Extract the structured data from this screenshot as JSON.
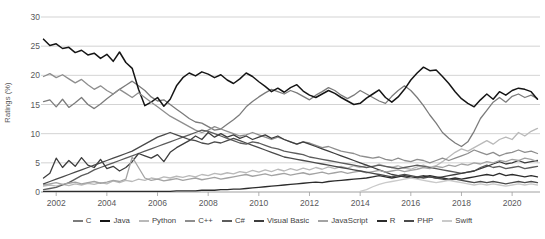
{
  "chart_data": {
    "type": "line",
    "title": "",
    "subtitle": "",
    "xlabel": "",
    "ylabel": "Ratings (%)",
    "xlim": [
      2001.4,
      2021.1
    ],
    "ylim": [
      0,
      30
    ],
    "grid": true,
    "grid_axis": "y",
    "legend_position": "bottom",
    "y_ticks": [
      0,
      5,
      10,
      15,
      20,
      25,
      30
    ],
    "y_tick_labels": [
      "0",
      "5",
      "10",
      "15",
      "20",
      "25",
      "30"
    ],
    "x_ticks": [
      2002,
      2004,
      2006,
      2008,
      2010,
      2012,
      2014,
      2016,
      2018,
      2020
    ],
    "x_tick_labels": [
      "2002",
      "2004",
      "2006",
      "2008",
      "2010",
      "2012",
      "2014",
      "2016",
      "2018",
      "2020"
    ],
    "x": [
      2001.5,
      2001.75,
      2002.0,
      2002.25,
      2002.5,
      2002.75,
      2003.0,
      2003.25,
      2003.5,
      2003.75,
      2004.0,
      2004.25,
      2004.5,
      2004.75,
      2005.0,
      2005.25,
      2005.5,
      2005.75,
      2006.0,
      2006.25,
      2006.5,
      2006.75,
      2007.0,
      2007.25,
      2007.5,
      2007.75,
      2008.0,
      2008.25,
      2008.5,
      2008.75,
      2009.0,
      2009.25,
      2009.5,
      2009.75,
      2010.0,
      2010.25,
      2010.5,
      2010.75,
      2011.0,
      2011.25,
      2011.5,
      2011.75,
      2012.0,
      2012.25,
      2012.5,
      2012.75,
      2013.0,
      2013.25,
      2013.5,
      2013.75,
      2014.0,
      2014.25,
      2014.5,
      2014.75,
      2015.0,
      2015.25,
      2015.5,
      2015.75,
      2016.0,
      2016.25,
      2016.5,
      2016.75,
      2017.0,
      2017.25,
      2017.5,
      2017.75,
      2018.0,
      2018.25,
      2018.5,
      2018.75,
      2019.0,
      2019.25,
      2019.5,
      2019.75,
      2020.0,
      2020.25,
      2020.5,
      2020.75,
      2021.0
    ],
    "series": [
      {
        "name": "C",
        "color": "#7b7b7b",
        "width": 1.3,
        "values": [
          15.5,
          15.8,
          14.6,
          15.9,
          14.5,
          15.3,
          16.2,
          15.0,
          14.3,
          15.1,
          16.0,
          16.8,
          17.6,
          18.3,
          19.0,
          18.2,
          17.4,
          16.3,
          15.6,
          15.8,
          15.0,
          14.2,
          13.4,
          12.6,
          12.0,
          11.8,
          11.2,
          10.6,
          10.8,
          11.6,
          12.4,
          13.3,
          14.6,
          15.5,
          16.3,
          17.0,
          17.6,
          17.2,
          16.8,
          17.4,
          17.0,
          16.4,
          15.8,
          16.6,
          17.2,
          17.9,
          17.4,
          16.6,
          16.0,
          16.6,
          17.4,
          16.8,
          16.2,
          15.6,
          15.2,
          16.4,
          17.4,
          18.2,
          17.4,
          16.2,
          14.8,
          13.2,
          11.8,
          10.2,
          9.2,
          8.4,
          7.8,
          8.6,
          10.4,
          12.6,
          14.0,
          15.4,
          16.2,
          15.4,
          16.4,
          16.8,
          16.2,
          16.6,
          16.0
        ]
      },
      {
        "name": "Java",
        "color": "#151515",
        "width": 1.5,
        "values": [
          26.2,
          25.1,
          25.4,
          24.6,
          24.8,
          23.9,
          24.3,
          23.5,
          23.8,
          22.9,
          23.6,
          22.4,
          24.0,
          22.2,
          21.2,
          17.6,
          14.8,
          15.4,
          16.2,
          14.7,
          15.9,
          18.2,
          19.6,
          20.4,
          19.9,
          20.6,
          20.2,
          19.6,
          20.1,
          19.2,
          18.6,
          19.4,
          20.4,
          19.8,
          18.9,
          18.1,
          17.2,
          17.8,
          17.1,
          17.9,
          18.4,
          17.3,
          16.6,
          16.2,
          16.8,
          17.4,
          16.9,
          16.2,
          15.6,
          15.0,
          15.2,
          16.1,
          16.8,
          17.5,
          16.2,
          15.4,
          16.3,
          17.6,
          19.2,
          20.4,
          21.4,
          20.8,
          20.9,
          19.8,
          18.6,
          17.2,
          16.0,
          15.2,
          14.6,
          15.8,
          16.8,
          15.9,
          17.2,
          16.6,
          17.4,
          17.8,
          17.6,
          17.2,
          15.9
        ]
      },
      {
        "name": "Python",
        "color": "#b9b9b9",
        "width": 1.3,
        "values": [
          1.0,
          1.2,
          1.0,
          1.3,
          1.1,
          1.4,
          1.2,
          1.5,
          1.3,
          1.6,
          1.4,
          1.9,
          1.6,
          2.0,
          1.8,
          2.2,
          2.0,
          2.4,
          2.2,
          2.6,
          2.4,
          2.7,
          2.5,
          2.8,
          2.6,
          3.0,
          2.8,
          3.2,
          3.0,
          3.3,
          3.1,
          3.5,
          3.3,
          3.7,
          3.4,
          3.8,
          3.5,
          3.9,
          3.6,
          4.0,
          3.7,
          4.1,
          3.8,
          4.2,
          3.9,
          4.3,
          4.0,
          4.4,
          4.1,
          4.5,
          4.2,
          4.6,
          4.3,
          4.8,
          4.4,
          4.2,
          4.5,
          4.1,
          3.9,
          4.3,
          4.6,
          4.2,
          4.5,
          5.2,
          6.0,
          6.8,
          7.4,
          7.0,
          7.6,
          8.2,
          8.8,
          8.2,
          9.0,
          9.4,
          9.0,
          10.2,
          9.6,
          10.4,
          10.9
        ]
      },
      {
        "name": "C++",
        "color": "#8e8e8e",
        "width": 1.3,
        "values": [
          19.8,
          20.3,
          19.6,
          20.1,
          19.4,
          18.7,
          19.3,
          18.4,
          17.6,
          18.2,
          17.4,
          16.8,
          17.6,
          16.9,
          16.2,
          17.0,
          16.2,
          15.4,
          14.6,
          13.8,
          13.0,
          12.4,
          11.8,
          11.2,
          10.6,
          10.2,
          10.6,
          11.2,
          10.8,
          10.4,
          10.0,
          9.6,
          9.8,
          10.2,
          9.8,
          9.4,
          9.0,
          9.4,
          9.0,
          8.6,
          8.2,
          8.6,
          8.4,
          8.0,
          7.6,
          7.8,
          7.4,
          7.0,
          6.8,
          6.6,
          6.2,
          6.0,
          5.8,
          6.0,
          5.6,
          5.4,
          5.8,
          5.4,
          5.2,
          5.6,
          5.4,
          5.0,
          5.4,
          5.8,
          5.4,
          5.8,
          6.2,
          6.6,
          7.2,
          6.8,
          6.4,
          6.8,
          6.2,
          6.6,
          6.8,
          7.2,
          6.8,
          7.0,
          6.6
        ]
      },
      {
        "name": "C#",
        "color": "#5c5c5c",
        "width": 1.3,
        "values": [
          0.4,
          0.6,
          0.8,
          1.2,
          1.6,
          2.2,
          2.8,
          3.2,
          3.8,
          4.2,
          4.6,
          5.0,
          5.4,
          5.8,
          6.2,
          6.6,
          7.0,
          7.4,
          7.8,
          8.2,
          8.6,
          9.0,
          9.4,
          9.8,
          10.2,
          10.6,
          10.4,
          10.0,
          9.6,
          9.2,
          8.8,
          8.4,
          8.2,
          8.6,
          8.4,
          8.0,
          7.6,
          7.4,
          7.0,
          6.8,
          6.6,
          6.4,
          6.0,
          5.8,
          5.6,
          5.4,
          5.2,
          5.0,
          4.8,
          4.6,
          4.4,
          4.2,
          4.4,
          4.6,
          4.4,
          4.2,
          4.0,
          4.2,
          4.4,
          4.6,
          4.4,
          4.2,
          4.0,
          3.8,
          3.6,
          3.4,
          3.2,
          3.4,
          3.6,
          4.2,
          4.6,
          4.2,
          4.4,
          4.0,
          4.2,
          4.4,
          4.0,
          4.2,
          4.4
        ]
      },
      {
        "name": "Visual Basic",
        "color": "#3d3d3d",
        "width": 1.3,
        "values": [
          2.4,
          3.2,
          5.8,
          4.2,
          5.4,
          4.4,
          5.9,
          4.6,
          4.2,
          5.6,
          4.0,
          4.4,
          3.6,
          4.2,
          5.2,
          6.6,
          6.2,
          5.8,
          6.4,
          5.2,
          6.8,
          7.6,
          8.2,
          8.8,
          9.6,
          9.0,
          10.2,
          9.4,
          10.0,
          9.4,
          9.8,
          9.2,
          9.6,
          9.0,
          9.4,
          9.8,
          9.2,
          9.6,
          9.0,
          8.6,
          8.2,
          8.6,
          8.2,
          7.8,
          7.4,
          7.0,
          6.6,
          6.2,
          5.8,
          5.4,
          5.0,
          4.6,
          4.2,
          3.8,
          3.4,
          3.0,
          2.8,
          2.6,
          2.4,
          2.6,
          2.8,
          2.6,
          2.4,
          2.6,
          2.8,
          3.0,
          3.2,
          3.4,
          3.6,
          4.0,
          4.4,
          4.8,
          5.2,
          4.8,
          5.0,
          5.4,
          5.0,
          5.2,
          5.4
        ]
      },
      {
        "name": "JavaScript",
        "color": "#a3a3a3",
        "width": 1.3,
        "values": [
          1.2,
          1.4,
          1.6,
          1.3,
          1.5,
          1.7,
          1.4,
          1.6,
          1.8,
          1.5,
          1.7,
          2.0,
          1.8,
          2.2,
          6.0,
          4.2,
          2.4,
          2.0,
          2.2,
          1.9,
          2.1,
          2.3,
          2.0,
          2.2,
          2.4,
          2.1,
          2.3,
          2.5,
          2.2,
          2.4,
          2.6,
          2.8,
          3.0,
          2.7,
          2.9,
          3.1,
          2.8,
          3.0,
          3.2,
          2.9,
          3.1,
          3.3,
          3.0,
          3.2,
          3.4,
          3.1,
          3.3,
          3.5,
          3.2,
          3.4,
          3.6,
          3.3,
          3.5,
          3.7,
          3.4,
          3.6,
          3.8,
          3.5,
          3.7,
          3.9,
          4.2,
          4.0,
          4.4,
          4.2,
          4.6,
          4.4,
          4.8,
          4.6,
          5.0,
          4.8,
          5.2,
          5.0,
          5.4,
          5.2,
          5.6,
          5.4,
          5.8,
          5.6,
          5.2
        ]
      },
      {
        "name": "R",
        "color": "#2c2c2c",
        "width": 1.3,
        "values": [
          0.1,
          0.1,
          0.1,
          0.1,
          0.1,
          0.1,
          0.1,
          0.1,
          0.1,
          0.1,
          0.1,
          0.1,
          0.1,
          0.1,
          0.1,
          0.1,
          0.1,
          0.1,
          0.1,
          0.1,
          0.1,
          0.2,
          0.2,
          0.2,
          0.2,
          0.3,
          0.3,
          0.3,
          0.4,
          0.4,
          0.5,
          0.5,
          0.6,
          0.7,
          0.8,
          0.9,
          1.0,
          1.1,
          1.2,
          1.3,
          1.4,
          1.5,
          1.6,
          1.7,
          1.6,
          1.8,
          1.9,
          2.0,
          2.1,
          2.2,
          2.3,
          2.4,
          2.6,
          2.8,
          2.6,
          2.4,
          2.6,
          2.8,
          2.6,
          2.4,
          2.6,
          2.8,
          2.6,
          2.4,
          2.2,
          2.4,
          2.2,
          2.4,
          2.6,
          2.8,
          3.0,
          2.8,
          3.2,
          2.8,
          3.0,
          2.8,
          2.6,
          2.8,
          2.6
        ]
      },
      {
        "name": "PHP",
        "color": "#4a4a4a",
        "width": 1.3,
        "values": [
          1.4,
          1.8,
          2.2,
          2.6,
          3.0,
          3.4,
          3.8,
          4.2,
          4.6,
          5.0,
          5.4,
          5.8,
          6.2,
          6.6,
          7.0,
          7.6,
          8.2,
          8.8,
          9.4,
          9.8,
          10.2,
          9.8,
          9.4,
          9.0,
          8.8,
          8.4,
          8.2,
          8.6,
          8.4,
          8.8,
          9.2,
          8.8,
          8.4,
          8.0,
          7.6,
          7.2,
          6.8,
          6.4,
          6.0,
          5.8,
          5.6,
          5.4,
          5.2,
          5.0,
          4.8,
          4.6,
          4.4,
          4.2,
          4.0,
          3.8,
          3.6,
          3.4,
          3.2,
          3.0,
          2.8,
          2.6,
          2.8,
          3.0,
          2.8,
          2.6,
          2.4,
          2.6,
          2.4,
          2.2,
          2.0,
          2.2,
          2.0,
          1.8,
          1.6,
          1.8,
          1.6,
          1.8,
          1.6,
          1.4,
          1.6,
          1.8,
          1.6,
          1.8,
          1.6
        ]
      },
      {
        "name": "Swift",
        "color": "#cacaca",
        "width": 1.3,
        "values": [
          null,
          null,
          null,
          null,
          null,
          null,
          null,
          null,
          null,
          null,
          null,
          null,
          null,
          null,
          null,
          null,
          null,
          null,
          null,
          null,
          null,
          null,
          null,
          null,
          null,
          null,
          null,
          null,
          null,
          null,
          null,
          null,
          null,
          null,
          null,
          null,
          null,
          null,
          null,
          null,
          null,
          null,
          null,
          null,
          null,
          null,
          null,
          null,
          null,
          null,
          0.1,
          0.4,
          0.9,
          1.3,
          1.6,
          1.8,
          2.0,
          2.2,
          2.4,
          2.2,
          2.0,
          1.8,
          1.6,
          1.8,
          2.0,
          1.8,
          1.6,
          1.4,
          1.2,
          1.4,
          1.2,
          1.4,
          1.2,
          1.0,
          1.2,
          1.4,
          1.2,
          1.4,
          1.2
        ]
      }
    ]
  },
  "legend": {
    "items": [
      {
        "label": "C",
        "color": "#7b7b7b"
      },
      {
        "label": "Java",
        "color": "#151515"
      },
      {
        "label": "Python",
        "color": "#b9b9b9"
      },
      {
        "label": "C++",
        "color": "#8e8e8e"
      },
      {
        "label": "C#",
        "color": "#5c5c5c"
      },
      {
        "label": "Visual Basic",
        "color": "#3d3d3d"
      },
      {
        "label": "JavaScript",
        "color": "#a3a3a3"
      },
      {
        "label": "R",
        "color": "#2c2c2c"
      },
      {
        "label": "PHP",
        "color": "#4a4a4a"
      },
      {
        "label": "Swift",
        "color": "#cacaca"
      }
    ]
  },
  "style": {
    "grid_color": "#c8c8c8",
    "axis_color": "#a0a0a0",
    "tick_color": "#59595b",
    "background": "#ffffff"
  }
}
